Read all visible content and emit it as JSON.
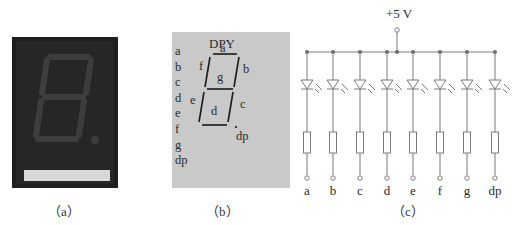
{
  "figure": {
    "panels": [
      {
        "id": "a",
        "caption": "（a）",
        "description": "photo of a 7-segment LED display",
        "colors": {
          "body": "#1f1f1f",
          "segments": "#3a3a3a",
          "base_strip": "#d8d8d8"
        }
      },
      {
        "id": "b",
        "caption": "（b）",
        "title": "DPY",
        "pins": [
          "a",
          "b",
          "c",
          "d",
          "e",
          "f",
          "g",
          "dp"
        ],
        "segments": [
          "a",
          "b",
          "c",
          "d",
          "e",
          "f",
          "g",
          "dp"
        ],
        "colors": {
          "background": "#c9c9c9",
          "lines": "#1a1a1a"
        }
      },
      {
        "id": "c",
        "caption": "（c）",
        "supply_label": "+5 V",
        "components": {
          "led_count": 8,
          "resistor_count": 8
        },
        "terminals": [
          "a",
          "b",
          "c",
          "d",
          "e",
          "f",
          "g",
          "dp"
        ],
        "colors": {
          "wire": "#7a7a7a",
          "node": "#6a6a6a"
        }
      }
    ]
  }
}
